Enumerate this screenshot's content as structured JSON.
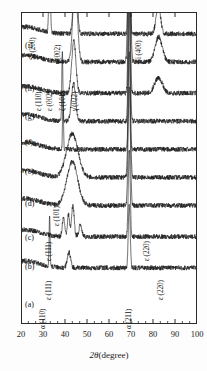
{
  "chart_data": {
    "type": "line",
    "title": "",
    "xlabel": "2θ(degree)",
    "ylabel": "Intensity(arb. units)",
    "xlim": [
      20,
      100
    ],
    "ylim": [
      0,
      100
    ],
    "grid": false,
    "legend_position": "none",
    "xticks": [
      20,
      30,
      40,
      50,
      60,
      70,
      80,
      90,
      100
    ],
    "xtick_labels": [
      "20",
      "30",
      "40",
      "50",
      "60",
      "70",
      "80",
      "90",
      "100"
    ],
    "minor_ticks_per_interval": 2,
    "yticks": [],
    "ytick_labels": [],
    "series": [
      {
        "name": "(a)",
        "label": "(a)",
        "baseline": 93,
        "peaks": [
          {
            "x": 33.0,
            "height": 30,
            "width": 0.45,
            "note": "Si (200)"
          },
          {
            "x": 44.7,
            "height": 26,
            "width": 1.1,
            "note": "α (110)"
          },
          {
            "x": 69.2,
            "height": 95,
            "width": 0.5,
            "note": "Si (400)"
          },
          {
            "x": 82.4,
            "height": 9,
            "width": 1.4,
            "note": "α (211)"
          }
        ]
      },
      {
        "name": "(b)",
        "label": "(b)",
        "baseline": 84,
        "peaks": [
          {
            "x": 44.6,
            "height": 26,
            "width": 1.4,
            "note": "ε (111)"
          },
          {
            "x": 69.2,
            "height": 70,
            "width": 0.7,
            "note": "Si (400)"
          },
          {
            "x": 82.6,
            "height": 8,
            "width": 2.2,
            "note": "ε (220)"
          }
        ]
      },
      {
        "name": "(c)",
        "label": "(c)",
        "baseline": 74,
        "peaks": [
          {
            "x": 44.0,
            "height": 17,
            "width": 1.3,
            "note": "ε (111)"
          },
          {
            "x": 69.2,
            "height": 58,
            "width": 0.6,
            "note": "Si (400)"
          },
          {
            "x": 82.5,
            "height": 5,
            "width": 2.4,
            "note": "ε (220)"
          }
        ]
      },
      {
        "name": "(d)",
        "label": "(d)",
        "baseline": 65,
        "peaks": [
          {
            "x": 38.8,
            "height": 22,
            "width": 0.35,
            "note": "sharp spike"
          },
          {
            "x": 43.9,
            "height": 12,
            "width": 1.3,
            "note": "ε (101)"
          },
          {
            "x": 69.2,
            "height": 50,
            "width": 0.6,
            "note": "Si (400)"
          }
        ]
      },
      {
        "name": "(e)",
        "label": "(e)",
        "baseline": 56,
        "peaks": [
          {
            "x": 39.1,
            "height": 17,
            "width": 0.3,
            "note": "sharp spike"
          },
          {
            "x": 69.2,
            "height": 45,
            "width": 0.55,
            "note": "Si (400)"
          }
        ]
      },
      {
        "name": "(f)",
        "label": "(f)",
        "baseline": 47,
        "peaks": [
          {
            "x": 43.3,
            "height": 14,
            "width": 3.6,
            "note": "broad amorphous hump"
          },
          {
            "x": 69.2,
            "height": 40,
            "width": 0.7,
            "note": "Si (400)"
          }
        ]
      },
      {
        "name": "(g)",
        "label": "(g)",
        "baseline": 38,
        "peaks": [
          {
            "x": 43.3,
            "height": 14,
            "width": 3.4,
            "note": "broad amorphous hump"
          },
          {
            "x": 69.2,
            "height": 38,
            "width": 0.7,
            "note": "Si (400)"
          }
        ]
      },
      {
        "name": "(h)",
        "label": "(h)",
        "baseline": 28,
        "peaks": [
          {
            "x": 39.3,
            "height": 6,
            "width": 0.7,
            "note": "ε (110)"
          },
          {
            "x": 41.6,
            "height": 7,
            "width": 0.7,
            "note": "ε (002)"
          },
          {
            "x": 43.6,
            "height": 10,
            "width": 0.8,
            "note": "ζ (101)"
          },
          {
            "x": 47.0,
            "height": 4,
            "width": 0.9,
            "note": "γ'(022)"
          },
          {
            "x": 69.2,
            "height": 28,
            "width": 0.6,
            "note": "Si (400)"
          }
        ]
      },
      {
        "name": "(i)",
        "label": "(i)",
        "baseline": 18,
        "peaks": [
          {
            "x": 33.0,
            "height": 16,
            "width": 0.3,
            "note": "Si (200)"
          },
          {
            "x": 41.8,
            "height": 5,
            "width": 1.0,
            "note": "γ'(002)"
          },
          {
            "x": 69.2,
            "height": 20,
            "width": 0.6,
            "note": "Si (400)"
          }
        ]
      }
    ],
    "peak_annotations": [
      {
        "id": "si-200",
        "text": "Si (200)",
        "x_px": 37,
        "y_px": 52,
        "rotated": true
      },
      {
        "id": "gamma-002",
        "text": "γ'(002)",
        "x_px": 62,
        "y_px": 56,
        "rotated": true
      },
      {
        "id": "si-400",
        "text": "Si (400)",
        "x_px": 143,
        "y_px": 55,
        "rotated": true
      },
      {
        "id": "eps-110",
        "text": "ε (110)",
        "x_px": 43,
        "y_px": 103,
        "rotated": true
      },
      {
        "id": "eps-002",
        "text": "ε (002)",
        "x_px": 54,
        "y_px": 103,
        "rotated": true
      },
      {
        "id": "zeta-101",
        "text": "ζ (101)",
        "x_px": 67,
        "y_px": 103,
        "rotated": true
      },
      {
        "id": "gamma-022",
        "text": "γ'(022)",
        "x_px": 79,
        "y_px": 103,
        "rotated": true
      },
      {
        "id": "eps-101",
        "text": "ε (101)",
        "x_px": 61,
        "y_px": 218,
        "rotated": true
      },
      {
        "id": "eps-111-c",
        "text": "ε (111)",
        "x_px": 53,
        "y_px": 253,
        "rotated": true
      },
      {
        "id": "eps-220-c",
        "text": "ε (220)",
        "x_px": 151,
        "y_px": 253,
        "rotated": true
      },
      {
        "id": "eps-111-b",
        "text": "ε (111)",
        "x_px": 53,
        "y_px": 292,
        "rotated": true
      },
      {
        "id": "eps-220-b",
        "text": "ε (220)",
        "x_px": 165,
        "y_px": 292,
        "rotated": true
      },
      {
        "id": "alpha-110",
        "text": "α (110)",
        "x_px": 47,
        "y_px": 321,
        "rotated": true
      },
      {
        "id": "alpha-211",
        "text": "α (211)",
        "x_px": 133,
        "y_px": 321,
        "rotated": true
      }
    ],
    "curve_labels": [
      {
        "id": "label-i",
        "text": "(i)",
        "x_px": 25,
        "y_px": 41
      },
      {
        "id": "label-h",
        "text": "(h)",
        "x_px": 25,
        "y_px": 84
      },
      {
        "id": "label-g",
        "text": "(g)",
        "x_px": 25,
        "y_px": 112
      },
      {
        "id": "label-f",
        "text": "(f)",
        "x_px": 25,
        "y_px": 138
      },
      {
        "id": "label-e",
        "text": "(e)",
        "x_px": 25,
        "y_px": 167
      },
      {
        "id": "label-d",
        "text": "(d)",
        "x_px": 25,
        "y_px": 199
      },
      {
        "id": "label-c",
        "text": "(c)",
        "x_px": 25,
        "y_px": 233
      },
      {
        "id": "label-b",
        "text": "(b)",
        "x_px": 25,
        "y_px": 262
      },
      {
        "id": "label-a",
        "text": "(a)",
        "x_px": 25,
        "y_px": 300
      }
    ]
  },
  "style": {
    "curve_color": "#1a1a1a",
    "axis_color": "#2b2b2b",
    "background": "#ffffff"
  }
}
